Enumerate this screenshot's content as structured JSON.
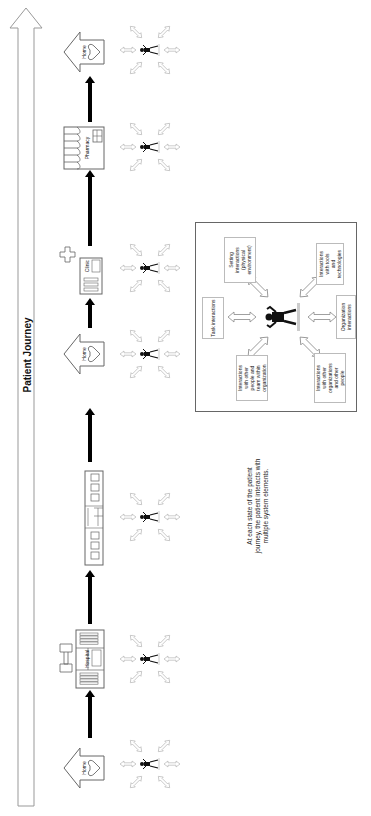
{
  "title": "Patient Journey",
  "journey": {
    "direction_label": "Patient Journey",
    "stages": [
      {
        "id": "home-1",
        "type": "home",
        "label": "Home"
      },
      {
        "id": "hospital",
        "type": "hospital",
        "label": "Hospital"
      },
      {
        "id": "care-facility",
        "type": "building",
        "label": ""
      },
      {
        "id": "home-2",
        "type": "home",
        "label": "Home"
      },
      {
        "id": "clinic",
        "type": "clinic",
        "label": "Clinic"
      },
      {
        "id": "pharmacy",
        "type": "pharmacy",
        "label": "Pharmacy"
      },
      {
        "id": "home-3",
        "type": "home",
        "label": "Home"
      }
    ]
  },
  "legend_box": {
    "center": "patient-figure",
    "elements": [
      {
        "id": "task",
        "label": "Task interactions"
      },
      {
        "id": "setting",
        "label": "Setting interactions (physical environment)"
      },
      {
        "id": "tools",
        "label": "Interactions with tools and technologies"
      },
      {
        "id": "organization",
        "label": "Organization interactions"
      },
      {
        "id": "other-orgs",
        "label": "Interactions with other organizations and other people"
      },
      {
        "id": "people-within",
        "label": "Interactions with other people and team within organization"
      }
    ]
  },
  "caption": {
    "line1": "At each state of the patient",
    "line2": "journey, the patient interacts with",
    "line3": "multiple system elements."
  },
  "colors": {
    "outline": "#777777",
    "arrow": "#000000",
    "box_border": "#666666"
  }
}
